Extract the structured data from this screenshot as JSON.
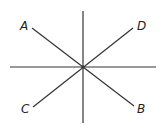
{
  "diagram": {
    "labels": {
      "A": "A",
      "B": "B",
      "C": "C",
      "D": "D"
    },
    "center": [
      83,
      67
    ],
    "lines": [
      {
        "name": "vertical",
        "from": [
          83,
          11
        ],
        "to": [
          83,
          123
        ]
      },
      {
        "name": "horizontal",
        "from": [
          10,
          67
        ],
        "to": [
          156,
          67
        ]
      },
      {
        "name": "AB",
        "from": [
          32,
          28
        ],
        "to": [
          134,
          106
        ]
      },
      {
        "name": "CD",
        "from": [
          33,
          107
        ],
        "to": [
          133,
          28
        ]
      }
    ],
    "colors": {
      "line": "#333333",
      "text": "#222222"
    }
  }
}
